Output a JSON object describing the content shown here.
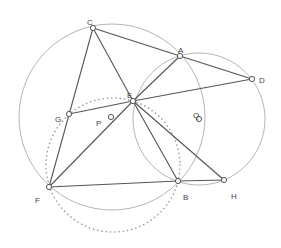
{
  "figure": {
    "width": 281,
    "height": 248,
    "colors": {
      "segment": "#555555",
      "circle": "#b5b5b5",
      "dotted": "#9a9a9a",
      "point_fill": "#ffffff",
      "point_stroke": "#555555",
      "label": "#444444"
    },
    "points": [
      {
        "name": "C",
        "x": 93,
        "y": 28,
        "lx": 87,
        "ly": 18
      },
      {
        "name": "A",
        "x": 180,
        "y": 56,
        "lx": 178,
        "ly": 46
      },
      {
        "name": "D",
        "x": 252,
        "y": 79,
        "lx": 259,
        "ly": 76
      },
      {
        "name": "E",
        "x": 133,
        "y": 101,
        "lx": 127,
        "ly": 91
      },
      {
        "name": "G",
        "x": 69,
        "y": 114,
        "lx": 55,
        "ly": 115
      },
      {
        "name": "P",
        "x": 111,
        "y": 117,
        "lx": 96,
        "ly": 119
      },
      {
        "name": "Q",
        "x": 199,
        "y": 119,
        "lx": 193,
        "ly": 111
      },
      {
        "name": "F",
        "x": 49,
        "y": 187,
        "lx": 35,
        "ly": 196
      },
      {
        "name": "B",
        "x": 178,
        "y": 181,
        "lx": 183,
        "ly": 193
      },
      {
        "name": "H",
        "x": 224,
        "y": 180,
        "lx": 231,
        "ly": 192
      }
    ],
    "segments": [
      [
        "C",
        "A"
      ],
      [
        "A",
        "D"
      ],
      [
        "C",
        "E"
      ],
      [
        "C",
        "F"
      ],
      [
        "G",
        "E"
      ],
      [
        "E",
        "D"
      ],
      [
        "E",
        "A"
      ],
      [
        "E",
        "F"
      ],
      [
        "E",
        "B"
      ],
      [
        "E",
        "H"
      ],
      [
        "F",
        "B"
      ],
      [
        "B",
        "H"
      ]
    ],
    "circles": [
      {
        "name": "circle-P",
        "cx": 112,
        "cy": 117,
        "r": 93,
        "style": "solid"
      },
      {
        "name": "circle-Q",
        "cx": 199,
        "cy": 119,
        "r": 66,
        "style": "solid"
      },
      {
        "name": "circle-dotted",
        "cx": 113,
        "cy": 165,
        "r": 67,
        "style": "dotted"
      }
    ]
  }
}
